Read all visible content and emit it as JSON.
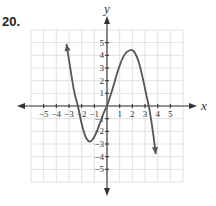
{
  "problem": {
    "number": "20."
  },
  "chart_data": {
    "type": "line",
    "title": "",
    "xlabel": "x",
    "ylabel": "y",
    "xlim": [
      -6,
      6
    ],
    "ylim": [
      -6,
      6
    ],
    "grid": true,
    "x_ticks": [
      -5,
      -4,
      -3,
      -2,
      -1,
      1,
      2,
      3,
      4,
      5
    ],
    "y_ticks": [
      -5,
      -4,
      -3,
      -2,
      -1,
      1,
      2,
      3,
      4,
      5
    ],
    "x_tick_labels": [
      "−5",
      "−4",
      "−3",
      "−2",
      "−1",
      "1",
      "2",
      "3",
      "4",
      "5"
    ],
    "y_tick_labels": [
      "−5",
      "−4",
      "−3",
      "−2",
      "−1",
      "1",
      "2",
      "3",
      "4",
      "5"
    ],
    "series": [
      {
        "name": "f(x)",
        "arrows": "both-ends",
        "color": "#555555",
        "x": [
          -3.2,
          -2.9,
          -2.6,
          -2.3,
          -2.0,
          -1.7,
          -1.4,
          -1.1,
          -0.8,
          -0.5,
          -0.2,
          0,
          0.3,
          0.6,
          0.9,
          1.2,
          1.5,
          1.8,
          2.0,
          2.2,
          2.5,
          2.8,
          3.1,
          3.3,
          3.5,
          3.7,
          3.85
        ],
        "y": [
          4.9,
          3.0,
          1.2,
          0.0,
          -1.4,
          -2.4,
          -2.8,
          -2.6,
          -2.0,
          -1.2,
          -0.4,
          0.0,
          0.9,
          1.9,
          2.9,
          3.7,
          4.2,
          4.4,
          4.4,
          4.2,
          3.5,
          2.3,
          0.9,
          0.0,
          -1.2,
          -2.6,
          -3.8
        ]
      }
    ]
  }
}
